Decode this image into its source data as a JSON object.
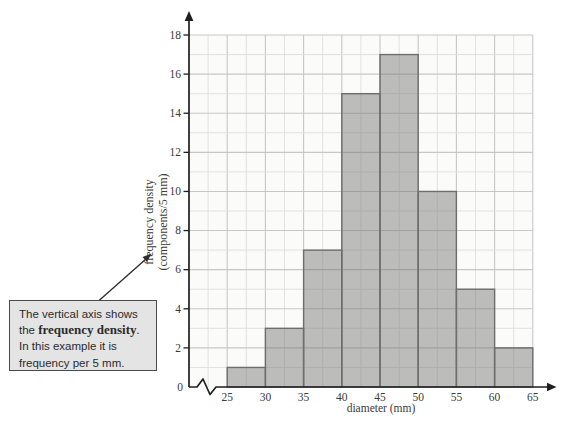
{
  "figure": {
    "type": "textbook-histogram-figure"
  },
  "chart_data": {
    "type": "bar",
    "title": "",
    "xlabel": "diameter (mm)",
    "ylabel_line1": "frequency density",
    "ylabel_line2": "(components/5 mm)",
    "bin_edges": [
      25,
      30,
      35,
      40,
      45,
      50,
      55,
      60,
      65
    ],
    "values": [
      1,
      3,
      7,
      15,
      17,
      10,
      5,
      2
    ],
    "x_ticks": [
      25,
      30,
      35,
      40,
      45,
      50,
      55,
      60,
      65
    ],
    "y_ticks": [
      2,
      4,
      6,
      8,
      10,
      12,
      14,
      16,
      18
    ],
    "origin_label": "0",
    "xlim_mm": [
      20,
      65
    ],
    "ylim": [
      0,
      18
    ],
    "axis_break_on_x": true,
    "grid": "on",
    "grid_minor_x_mm": 2.5,
    "grid_minor_y": 1,
    "colors": {
      "plot_bg": "#fbfbfa",
      "grid_minor": "#e1e1e1",
      "grid_major": "#c7c7c7",
      "bar_fill": "rgba(117,117,117,0.47)",
      "bar_stroke": "#6e6e6e",
      "axis": "#1f1f1f",
      "text": "#3a3a3a",
      "callout_bg": "#e4e4e4",
      "callout_border": "#4a4a4a"
    }
  },
  "callout": {
    "line1": "The vertical axis shows",
    "line2_pre": "the ",
    "line2_bold": "frequency density",
    "line2_post": ".",
    "line3": "In this example it is",
    "line4": "frequency per 5 mm."
  }
}
